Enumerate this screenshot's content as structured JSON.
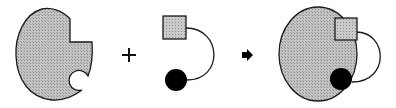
{
  "diagram": {
    "type": "binding-schematic",
    "colors": {
      "background": "#ffffff",
      "receptor_fill": "#b8b8b8",
      "ligand_square_fill": "#bdbdbd",
      "ligand_circle_fill": "#000000",
      "stroke": "#1a1a1a"
    },
    "elements": [
      {
        "id": "receptor",
        "label": "",
        "shape": "ellipse with square notch and circular pocket"
      },
      {
        "id": "plus-operator",
        "label": "+"
      },
      {
        "id": "ligand",
        "label": "",
        "shape": "square and filled circle joined by an arc linker"
      },
      {
        "id": "reaction-arrow",
        "label": ""
      },
      {
        "id": "complex",
        "label": "",
        "shape": "receptor with ligand bound in both sites"
      }
    ],
    "operators": {
      "plus": "+"
    }
  }
}
